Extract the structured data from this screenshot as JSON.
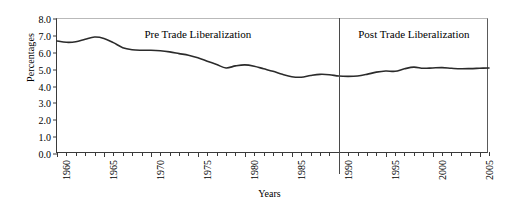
{
  "chart_data": {
    "type": "line",
    "title": "",
    "xlabel": "Years",
    "ylabel": "Percentages",
    "xlim": [
      1960,
      2006
    ],
    "ylim": [
      0.0,
      8.0
    ],
    "grid": false,
    "legend": "none",
    "y_ticks": [
      "0.0",
      "1.0",
      "2.0",
      "3.0",
      "4.0",
      "5.0",
      "6.0",
      "7.0",
      "8.0"
    ],
    "y_tick_values": [
      0,
      1,
      2,
      3,
      4,
      5,
      6,
      7,
      8
    ],
    "x_tick_labels": [
      "1960",
      "1965",
      "1970",
      "1975",
      "1980",
      "1985",
      "1990",
      "1995",
      "2000",
      "2005"
    ],
    "x_tick_values": [
      1960,
      1965,
      1970,
      1975,
      1980,
      1985,
      1990,
      1995,
      2000,
      2005
    ],
    "x_minor_interval": 1,
    "annotations": [
      {
        "text": "Pre Trade Liberalization",
        "x": 1975,
        "y": 7.0
      },
      {
        "text": "Post Trade Liberalization",
        "x": 1998,
        "y": 7.0
      }
    ],
    "divider": {
      "x": 1990,
      "label": "trade-liberalization-divider"
    },
    "series": [
      {
        "name": "Percentages",
        "color": "#2b2b2b",
        "x": [
          1960,
          1961,
          1962,
          1963,
          1964,
          1965,
          1966,
          1967,
          1968,
          1969,
          1970,
          1971,
          1972,
          1973,
          1974,
          1975,
          1976,
          1977,
          1978,
          1979,
          1980,
          1981,
          1982,
          1983,
          1984,
          1985,
          1986,
          1987,
          1988,
          1989,
          1990,
          1991,
          1992,
          1993,
          1994,
          1995,
          1996,
          1997,
          1998,
          1999,
          2000,
          2001,
          2002,
          2003,
          2004,
          2005,
          2006
        ],
        "values": [
          6.7,
          6.62,
          6.65,
          6.8,
          6.93,
          6.85,
          6.6,
          6.3,
          6.18,
          6.15,
          6.15,
          6.12,
          6.05,
          5.95,
          5.85,
          5.7,
          5.5,
          5.3,
          5.1,
          5.22,
          5.28,
          5.2,
          5.05,
          4.9,
          4.72,
          4.58,
          4.55,
          4.65,
          4.72,
          4.7,
          4.62,
          4.6,
          4.62,
          4.72,
          4.85,
          4.92,
          4.9,
          5.05,
          5.15,
          5.08,
          5.1,
          5.12,
          5.08,
          5.05,
          5.06,
          5.08,
          5.1
        ]
      }
    ]
  }
}
